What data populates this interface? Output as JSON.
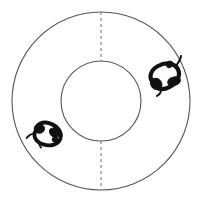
{
  "figure": {
    "type": "diagram",
    "background_color": "#ffffff",
    "canvas": {
      "width": 204,
      "height": 201
    }
  },
  "arena": {
    "shape_name": "annulus",
    "center": {
      "x": 101,
      "y": 101
    },
    "outer_circle": {
      "label": "outer wall",
      "radius": 89,
      "stroke_color": "#555555",
      "stroke_width": 1.1,
      "fill_color": "#ffffff",
      "dash": "none"
    },
    "inner_circle": {
      "label": "inner wall",
      "radius": 40,
      "stroke_color": "#555555",
      "stroke_width": 1.1,
      "fill_color": "#ffffff",
      "dash": "none"
    },
    "dividers": [
      {
        "name": "top-divider",
        "label": "top dashed boundary",
        "x": 101,
        "y_start": 12,
        "y_end": 61,
        "stroke_color": "#777777",
        "stroke_width": 1.1,
        "dash": "3 3"
      },
      {
        "name": "bottom-divider",
        "label": "bottom dashed boundary",
        "x": 101,
        "y_start": 141,
        "y_end": 190,
        "stroke_color": "#777777",
        "stroke_width": 1.1,
        "dash": "3 3"
      }
    ]
  },
  "animals": [
    {
      "name": "rodent-right",
      "label": "rodent in right corridor",
      "color": "#111111",
      "center": {
        "x": 165,
        "y": 77
      },
      "rotation_deg": -28,
      "scale": 1.0
    },
    {
      "name": "rodent-left",
      "label": "rodent in left corridor",
      "color": "#111111",
      "center": {
        "x": 47,
        "y": 135
      },
      "rotation_deg": 18,
      "scale": 0.92
    }
  ]
}
